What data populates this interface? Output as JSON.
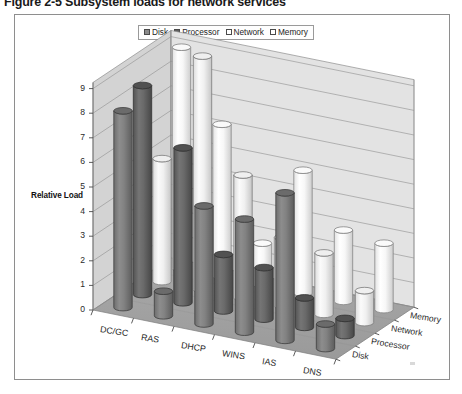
{
  "caption": "Figure 2-5  Subsystem loads for network services",
  "legend": {
    "position": "top-center",
    "entries": [
      {
        "label": "Disk",
        "color": "#7a7a7a"
      },
      {
        "label": "Processor",
        "color": "#5e5e5e"
      },
      {
        "label": "Network",
        "color": "#f2f2f2"
      },
      {
        "label": "Memory",
        "color": "#fbfbfb"
      }
    ]
  },
  "axes": {
    "y_title": "Relative Load",
    "y_ticks": [
      "0",
      "1",
      "2",
      "3",
      "4",
      "5",
      "6",
      "7",
      "8",
      "9"
    ],
    "x_categories": [
      "DC/GC",
      "RAS",
      "DHCP",
      "WINS",
      "IAS",
      "DNS"
    ],
    "z_categories": [
      "Memory",
      "Network",
      "Processor",
      "Disk"
    ]
  },
  "chart_data": {
    "type": "bar",
    "title": "Figure 2-5  Subsystem loads for network services",
    "subtitle": "",
    "xlabel": "",
    "ylabel": "Relative Load",
    "zlabel": "",
    "ylim": [
      0,
      9
    ],
    "grid": true,
    "legend_position": "top-center",
    "style": "3d-cylinder",
    "categories": [
      "DC/GC",
      "RAS",
      "DHCP",
      "WINS",
      "IAS",
      "DNS"
    ],
    "series": [
      {
        "name": "Disk",
        "values": [
          8.0,
          1.0,
          4.8,
          4.6,
          6.0,
          1.0
        ]
      },
      {
        "name": "Processor",
        "values": [
          8.5,
          6.3,
          2.3,
          2.1,
          1.2,
          0.7
        ]
      },
      {
        "name": "Network",
        "values": [
          5.0,
          9.5,
          5.0,
          2.8,
          2.5,
          1.3
        ]
      },
      {
        "name": "Memory",
        "values": [
          9.0,
          6.2,
          1.7,
          5.0,
          2.9,
          2.7
        ]
      }
    ],
    "annotations": []
  }
}
